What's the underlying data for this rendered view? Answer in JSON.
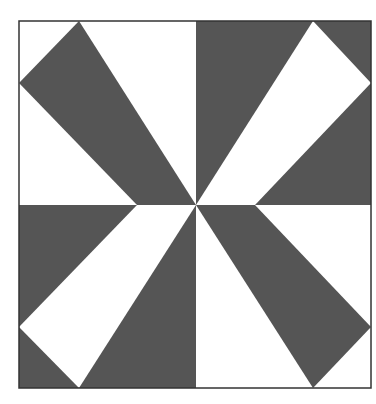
{
  "figure": {
    "title": "",
    "colors": {
      "background": "#ffffff",
      "dark": "#555555",
      "border": "#333333"
    },
    "square": {
      "x": 19,
      "y": 21,
      "w": 352,
      "h": 367
    },
    "center": {
      "x": 196,
      "y": 205
    },
    "quadrants": [
      {
        "name": "top-left",
        "background": "#ffffff",
        "shape_fill": "#555555",
        "points": "79,21 196,205 137,205 19,83"
      },
      {
        "name": "top-right",
        "background": "#555555",
        "shape_fill": "#ffffff",
        "points": "313,21 371,83 255,205 196,205"
      },
      {
        "name": "bottom-left",
        "background": "#555555",
        "shape_fill": "#ffffff",
        "points": "137,205 196,205 79,388 19,327"
      },
      {
        "name": "bottom-right",
        "background": "#ffffff",
        "shape_fill": "#555555",
        "points": "196,205 255,205 371,327 313,388"
      }
    ]
  }
}
